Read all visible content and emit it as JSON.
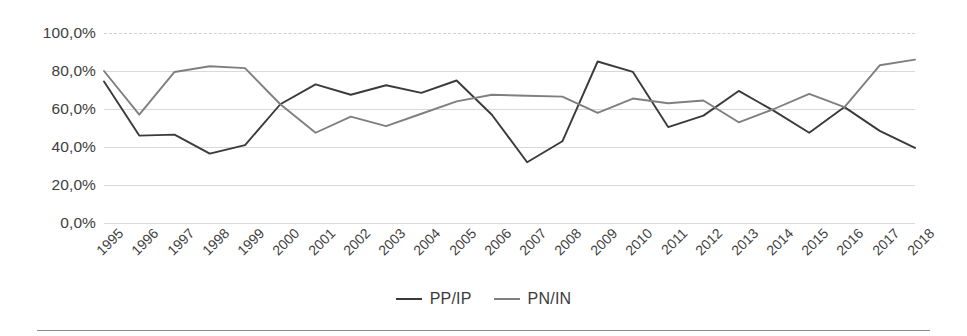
{
  "chart_data": {
    "type": "line",
    "title": "",
    "subtitle": "",
    "xlabel": "",
    "ylabel": "",
    "grid": true,
    "legend_position": "bottom-center",
    "ylim": [
      0,
      100
    ],
    "y_ticks": [
      0,
      20,
      40,
      60,
      80,
      100
    ],
    "y_tick_labels": [
      "0,0%",
      "20,0%",
      "40,0%",
      "60,0%",
      "80,0%",
      "100,0%"
    ],
    "categories": [
      "1995",
      "1996",
      "1997",
      "1998",
      "1999",
      "2000",
      "2001",
      "2002",
      "2003",
      "2004",
      "2005",
      "2006",
      "2007",
      "2008",
      "2009",
      "2010",
      "2011",
      "2012",
      "2013",
      "2014",
      "2015",
      "2016",
      "2017",
      "2018"
    ],
    "series": [
      {
        "name": "PP/IP",
        "color": "#3a3a3a",
        "values": [
          74.5,
          46.0,
          46.5,
          36.5,
          41.0,
          62.5,
          73.0,
          67.5,
          72.5,
          68.5,
          75.0,
          57.0,
          32.0,
          43.0,
          85.0,
          79.5,
          50.5,
          56.5,
          69.5,
          59.0,
          47.5,
          61.0,
          48.5,
          39.5
        ]
      },
      {
        "name": "PN/IN",
        "color": "#7f7f7f",
        "values": [
          80.0,
          57.0,
          79.5,
          82.5,
          81.5,
          62.5,
          47.5,
          56.0,
          51.0,
          57.5,
          64.0,
          67.5,
          67.0,
          66.5,
          58.0,
          65.5,
          63.0,
          64.5,
          53.0,
          60.0,
          68.0,
          61.0,
          83.0,
          86.0
        ]
      }
    ]
  },
  "legend": {
    "items": [
      {
        "label": "PP/IP",
        "color": "#3a3a3a"
      },
      {
        "label": "PN/IN",
        "color": "#7f7f7f"
      }
    ]
  }
}
